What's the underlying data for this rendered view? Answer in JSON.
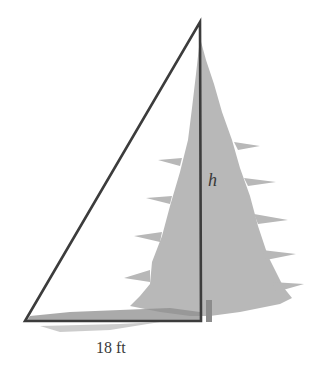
{
  "diagram": {
    "labels": {
      "height": "h",
      "base": "18 ft"
    },
    "colors": {
      "triangle": "#3c3c3c",
      "tree": "#b4b4b4",
      "shadow": "#8a8a8a",
      "background": "#ffffff"
    }
  }
}
